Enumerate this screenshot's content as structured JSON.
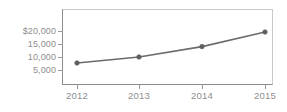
{
  "chart_data": {
    "type": "line",
    "title": "",
    "subtitle": "",
    "xlabel": "",
    "ylabel": "",
    "x": [
      "2012",
      "2013",
      "2014",
      "2015"
    ],
    "categories": [
      "2012",
      "2013",
      "2014",
      "2015"
    ],
    "values": [
      7700,
      10000,
      14000,
      19600
    ],
    "series": [
      {
        "name": "",
        "values": [
          7700,
          10000,
          14000,
          19600
        ]
      }
    ],
    "ylim": [
      0,
      22500
    ],
    "xlim": [
      "2012",
      "2015"
    ],
    "ytick_values": [
      5000,
      10000,
      15000,
      20000
    ],
    "ytick_labels": [
      "5,000",
      "10,000",
      "15,000",
      "$20,000"
    ],
    "xtick_labels": [
      "2012",
      "2013",
      "2014",
      "2015"
    ],
    "grid": false,
    "legend": false,
    "legend_position": "none",
    "annotations": [],
    "marker": "circle",
    "line_color": "#6c6c6c",
    "marker_color": "#5f5f5f",
    "axis_color": "#8c8c8c",
    "tick_label_color": "#8e8e8e",
    "plot_background": "#ffffff",
    "currency_symbol": "$"
  },
  "axes": {
    "y": {
      "ticks": [
        {
          "label": "$20,000",
          "value": 20000
        },
        {
          "label": "15,000",
          "value": 15000
        },
        {
          "label": "10,000",
          "value": 10000
        },
        {
          "label": "5,000",
          "value": 5000
        }
      ]
    },
    "x": {
      "ticks": [
        {
          "label": "2012",
          "value": 2012
        },
        {
          "label": "2013",
          "value": 2013
        },
        {
          "label": "2014",
          "value": 2014
        },
        {
          "label": "2015",
          "value": 2015
        }
      ]
    }
  }
}
